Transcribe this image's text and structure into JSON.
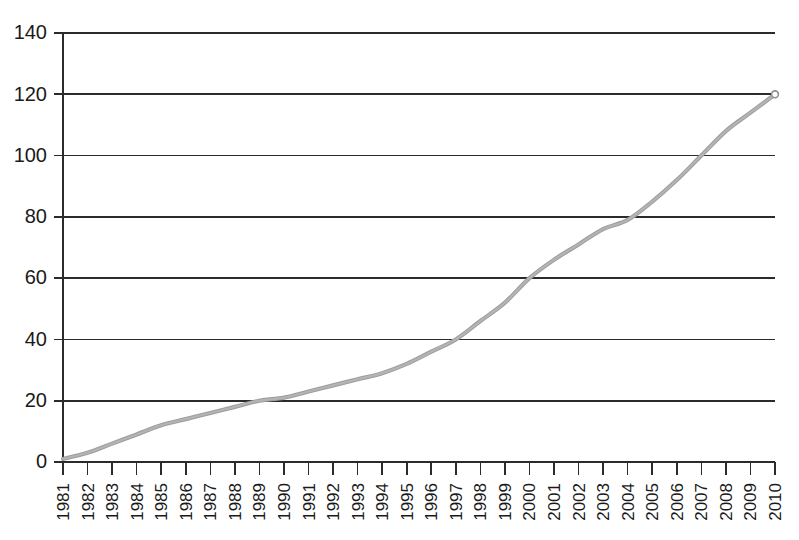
{
  "chart_data": {
    "type": "line",
    "title": "",
    "subtitle": "",
    "xlabel": "",
    "ylabel": "",
    "grid": true,
    "legend": false,
    "legend_position": "none",
    "xlim": [
      1981,
      2010
    ],
    "ylim": [
      0,
      140
    ],
    "ytick_values": [
      0,
      20,
      40,
      60,
      80,
      100,
      120,
      140
    ],
    "ytick_labels": [
      "0",
      "20",
      "40",
      "60",
      "80",
      "100",
      "120",
      "140"
    ],
    "categories": [
      "1981",
      "1982",
      "1983",
      "1984",
      "1985",
      "1986",
      "1987",
      "1988",
      "1989",
      "1990",
      "1991",
      "1992",
      "1993",
      "1994",
      "1995",
      "1996",
      "1997",
      "1998",
      "1999",
      "2000",
      "2001",
      "2002",
      "2003",
      "2004",
      "2005",
      "2006",
      "2007",
      "2008",
      "2009",
      "2010"
    ],
    "x": [
      1981,
      1982,
      1983,
      1984,
      1985,
      1986,
      1987,
      1988,
      1989,
      1990,
      1991,
      1992,
      1993,
      1994,
      1995,
      1996,
      1997,
      1998,
      1999,
      2000,
      2001,
      2002,
      2003,
      2004,
      2005,
      2006,
      2007,
      2008,
      2009,
      2010
    ],
    "values": [
      1,
      3,
      6,
      9,
      12,
      14,
      16,
      18,
      20,
      21,
      23,
      25,
      27,
      29,
      32,
      36,
      40,
      46,
      52,
      60,
      66,
      71,
      76,
      79,
      85,
      92,
      100,
      108,
      114,
      120
    ],
    "series": [
      {
        "name": "series-1",
        "color": "#9d9d9d",
        "marker": "endpoint-only",
        "values": [
          1,
          3,
          6,
          9,
          12,
          14,
          16,
          18,
          20,
          21,
          23,
          25,
          27,
          29,
          32,
          36,
          40,
          46,
          52,
          60,
          66,
          71,
          76,
          79,
          85,
          92,
          100,
          108,
          114,
          120
        ]
      }
    ],
    "annotations": []
  },
  "colors": {
    "background": "#ffffff",
    "axis": "#2b2b2b",
    "gridline": "#2b2b2b",
    "series": "#9d9d9d",
    "text": "#1a1a1a"
  }
}
